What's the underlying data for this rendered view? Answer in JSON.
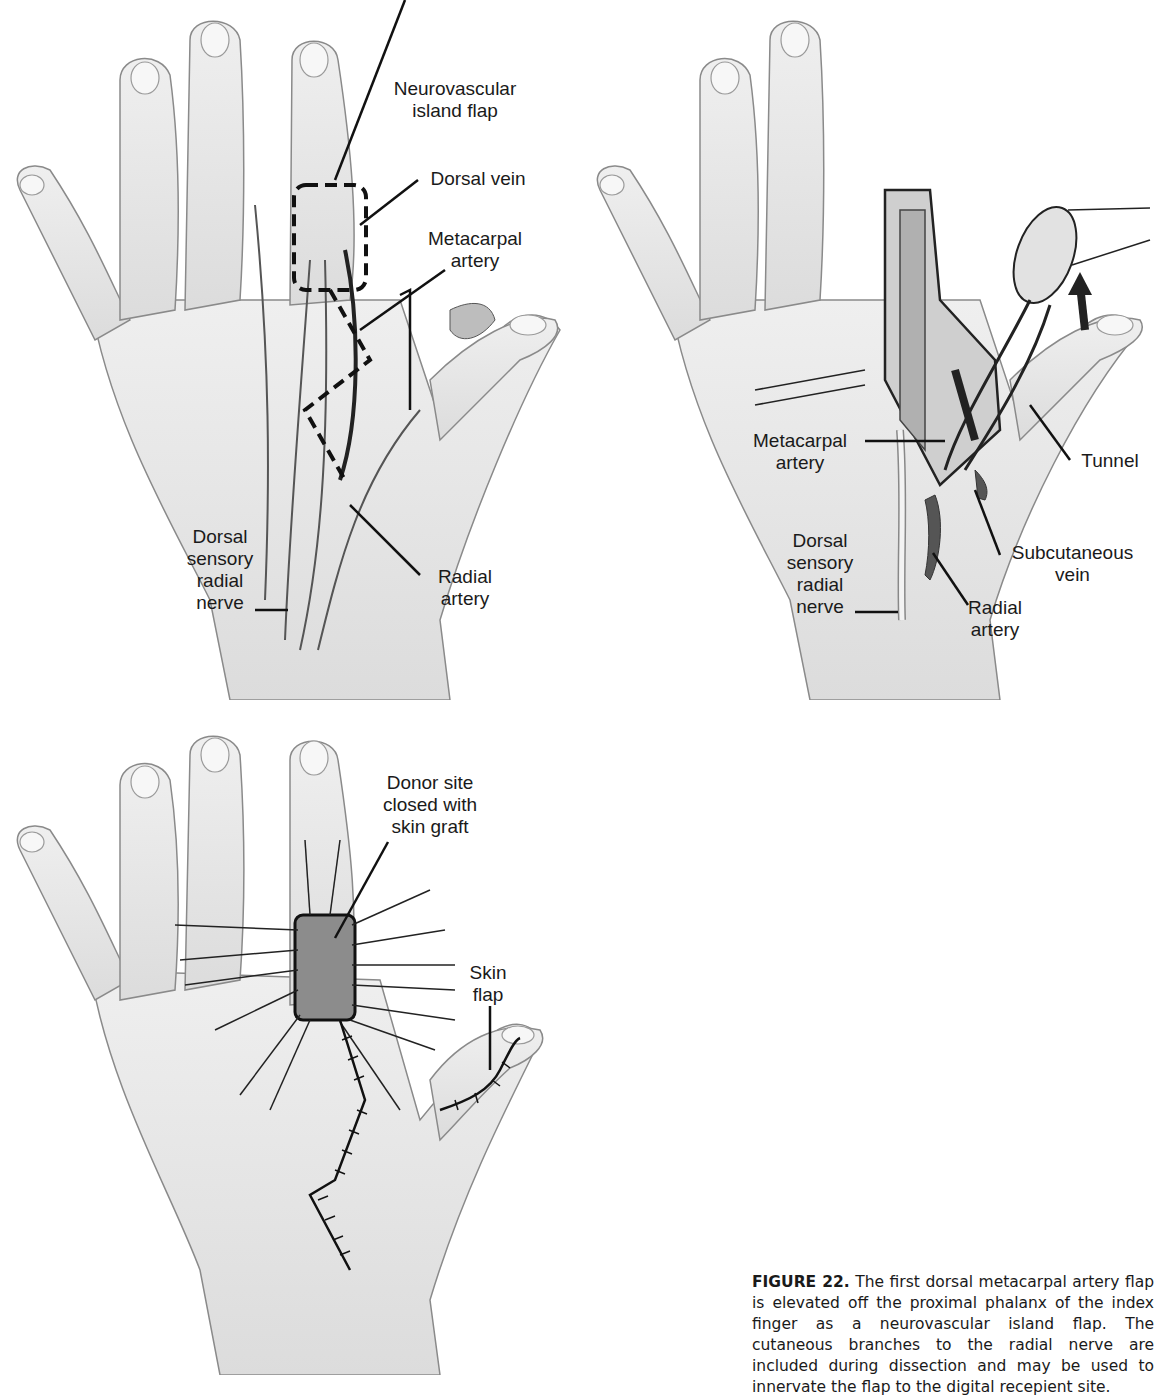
{
  "figure": {
    "panel_a": {
      "labels": {
        "neurovascular_island_flap": "Neurovascular\nisland flap",
        "dorsal_vein": "Dorsal vein",
        "metacarpal_artery": "Metacarpal\nartery",
        "dorsal_sensory_radial_nerve": "Dorsal\nsensory\nradial\nnerve",
        "radial_artery": "Radial\nartery"
      }
    },
    "panel_b": {
      "labels": {
        "metacarpal_artery": "Metacarpal\nartery",
        "tunnel": "Tunnel",
        "dorsal_sensory_radial_nerve": "Dorsal\nsensory\nradial\nnerve",
        "subcutaneous_vein": "Subcutaneous\nvein",
        "radial_artery": "Radial\nartery"
      }
    },
    "panel_c": {
      "labels": {
        "donor_site": "Donor site\nclosed with\nskin graft",
        "skin_flap": "Skin\nflap"
      }
    },
    "caption": {
      "figure_number": "FIGURE 22.",
      "text": " The first dorsal metacarpal artery flap is elevated off the proximal phalanx of the index finger as a neurovascular island flap. The cutaneous branches to the radial nerve are included during dissection and may be used to innervate the flap to the digital recepient site."
    },
    "colors": {
      "skin": "#e6e6e6",
      "outline": "#8a8a8a",
      "line": "#111111",
      "graft": "#8c8c8c"
    }
  }
}
